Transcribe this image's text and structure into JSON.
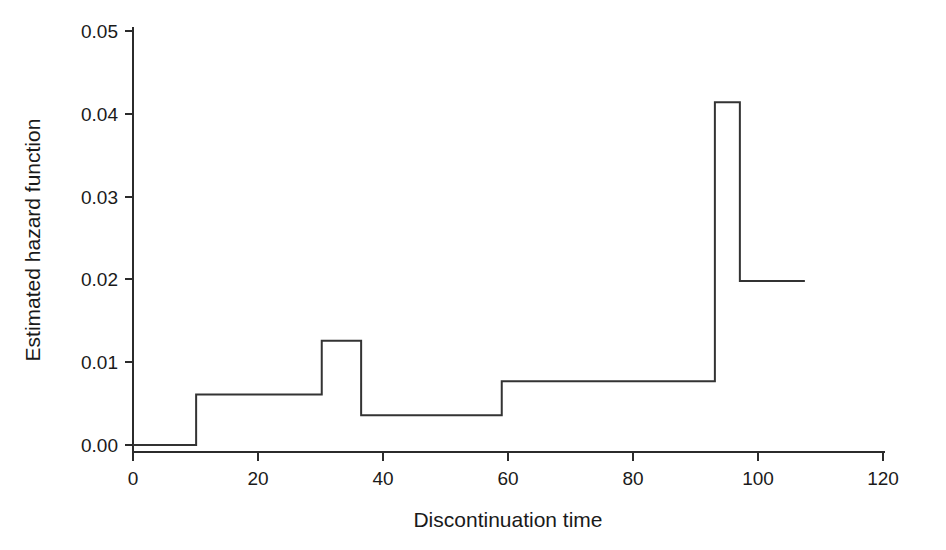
{
  "chart_data": {
    "type": "line",
    "subtype": "step-post",
    "title": "",
    "xlabel": "Discontinuation time",
    "ylabel": "Estimated hazard function",
    "xlim": [
      0,
      120
    ],
    "ylim": [
      0.0,
      0.05
    ],
    "xticks": [
      0,
      20,
      40,
      60,
      80,
      100,
      120
    ],
    "xtick_labels": [
      "0",
      "20",
      "40",
      "60",
      "80",
      "100",
      "120"
    ],
    "yticks": [
      0.0,
      0.01,
      0.02,
      0.03,
      0.04,
      0.05
    ],
    "ytick_labels": [
      "0.00",
      "0.01",
      "0.02",
      "0.03",
      "0.04",
      "0.05"
    ],
    "grid": false,
    "legend": false,
    "line_color": "#333333",
    "x": [
      0.0,
      10.1,
      30.2,
      36.5,
      59.0,
      93.1,
      97.1,
      107.5
    ],
    "y": [
      0.0,
      0.0061,
      0.0126,
      0.0036,
      0.0077,
      0.0414,
      0.0198,
      0.0198
    ],
    "segments": [
      {
        "x_start": 0.0,
        "x_end": 10.1,
        "value": 0.0
      },
      {
        "x_start": 10.1,
        "x_end": 30.2,
        "value": 0.0061
      },
      {
        "x_start": 30.2,
        "x_end": 36.5,
        "value": 0.0126
      },
      {
        "x_start": 36.5,
        "x_end": 59.0,
        "value": 0.0036
      },
      {
        "x_start": 59.0,
        "x_end": 93.1,
        "value": 0.0077
      },
      {
        "x_start": 93.1,
        "x_end": 97.1,
        "value": 0.0414
      },
      {
        "x_start": 97.1,
        "x_end": 107.5,
        "value": 0.0198
      }
    ]
  },
  "axes": {
    "x_title": "Discontinuation time",
    "y_title": "Estimated hazard function",
    "x_tick_0": "0",
    "x_tick_1": "20",
    "x_tick_2": "40",
    "x_tick_3": "60",
    "x_tick_4": "80",
    "x_tick_5": "100",
    "x_tick_6": "120",
    "y_tick_0": "0.00",
    "y_tick_1": "0.01",
    "y_tick_2": "0.02",
    "y_tick_3": "0.03",
    "y_tick_4": "0.04",
    "y_tick_5": "0.05"
  }
}
